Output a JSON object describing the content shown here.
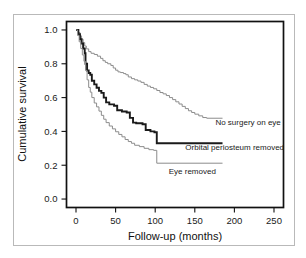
{
  "chart_data": {
    "type": "line",
    "subtype": "kaplan-meier-step",
    "title": "",
    "xlabel": "Follow-up (months)",
    "ylabel": "Cumulative survival",
    "xlim": [
      -12,
      262
    ],
    "ylim": [
      -0.05,
      1.05
    ],
    "xticks": [
      0,
      50,
      100,
      150,
      200,
      250
    ],
    "xticklabels": [
      "0",
      "50",
      "100",
      "150",
      "200",
      "250"
    ],
    "yticks": [
      0.0,
      0.2,
      0.4,
      0.6,
      0.8,
      1.0
    ],
    "yticklabels": [
      "0.0",
      "0.2",
      "0.4",
      "0.6",
      "0.8",
      "1.0"
    ],
    "grid": false,
    "legend_position": "inline-right-of-curve",
    "series": [
      {
        "name": "No surgery on eye",
        "label": "No surgery on eye",
        "color": "#8c8c8c",
        "stroke_width": 1.0,
        "label_x": 171,
        "label_y": 0.455,
        "points": [
          [
            0,
            1.0
          ],
          [
            3,
            0.985
          ],
          [
            5,
            0.965
          ],
          [
            7,
            0.945
          ],
          [
            9,
            0.925
          ],
          [
            11,
            0.905
          ],
          [
            13,
            0.888
          ],
          [
            16,
            0.872
          ],
          [
            19,
            0.862
          ],
          [
            23,
            0.855
          ],
          [
            27,
            0.845
          ],
          [
            31,
            0.832
          ],
          [
            34,
            0.818
          ],
          [
            37,
            0.808
          ],
          [
            40,
            0.8
          ],
          [
            44,
            0.79
          ],
          [
            47,
            0.775
          ],
          [
            50,
            0.762
          ],
          [
            53,
            0.752
          ],
          [
            56,
            0.748
          ],
          [
            60,
            0.742
          ],
          [
            63,
            0.735
          ],
          [
            66,
            0.722
          ],
          [
            70,
            0.712
          ],
          [
            74,
            0.705
          ],
          [
            78,
            0.698
          ],
          [
            82,
            0.69
          ],
          [
            86,
            0.678
          ],
          [
            90,
            0.668
          ],
          [
            94,
            0.66
          ],
          [
            98,
            0.652
          ],
          [
            102,
            0.642
          ],
          [
            106,
            0.63
          ],
          [
            110,
            0.622
          ],
          [
            114,
            0.612
          ],
          [
            118,
            0.6
          ],
          [
            122,
            0.588
          ],
          [
            126,
            0.575
          ],
          [
            130,
            0.562
          ],
          [
            134,
            0.548
          ],
          [
            138,
            0.535
          ],
          [
            142,
            0.522
          ],
          [
            146,
            0.512
          ],
          [
            150,
            0.502
          ],
          [
            155,
            0.492
          ],
          [
            160,
            0.482
          ],
          [
            165,
            0.478
          ],
          [
            185,
            0.478
          ]
        ]
      },
      {
        "name": "Orbital periosteum removed",
        "label": "Orbital periosteum removed",
        "color": "#1a1a1a",
        "stroke_width": 1.9,
        "label_x": 133,
        "label_y": 0.305,
        "points": [
          [
            0,
            1.0
          ],
          [
            3,
            0.975
          ],
          [
            5,
            0.945
          ],
          [
            7,
            0.92
          ],
          [
            9,
            0.89
          ],
          [
            11,
            0.862
          ],
          [
            12,
            0.8
          ],
          [
            14,
            0.76
          ],
          [
            16,
            0.745
          ],
          [
            18,
            0.735
          ],
          [
            20,
            0.7
          ],
          [
            23,
            0.678
          ],
          [
            26,
            0.658
          ],
          [
            29,
            0.64
          ],
          [
            32,
            0.628
          ],
          [
            35,
            0.6
          ],
          [
            38,
            0.572
          ],
          [
            42,
            0.56
          ],
          [
            48,
            0.552
          ],
          [
            52,
            0.525
          ],
          [
            58,
            0.518
          ],
          [
            64,
            0.512
          ],
          [
            68,
            0.48
          ],
          [
            72,
            0.452
          ],
          [
            76,
            0.448
          ],
          [
            84,
            0.442
          ],
          [
            88,
            0.408
          ],
          [
            94,
            0.4
          ],
          [
            99,
            0.395
          ],
          [
            102,
            0.33
          ],
          [
            185,
            0.33
          ]
        ]
      },
      {
        "name": "Eye removed",
        "label": "Eye removed",
        "color": "#8c8c8c",
        "stroke_width": 1.0,
        "label_x": 112,
        "label_y": 0.168,
        "points": [
          [
            0,
            1.0
          ],
          [
            2,
            0.968
          ],
          [
            4,
            0.93
          ],
          [
            6,
            0.89
          ],
          [
            8,
            0.852
          ],
          [
            10,
            0.815
          ],
          [
            12,
            0.76
          ],
          [
            14,
            0.705
          ],
          [
            16,
            0.66
          ],
          [
            18,
            0.632
          ],
          [
            20,
            0.6
          ],
          [
            23,
            0.568
          ],
          [
            26,
            0.545
          ],
          [
            29,
            0.52
          ],
          [
            32,
            0.495
          ],
          [
            35,
            0.472
          ],
          [
            38,
            0.452
          ],
          [
            42,
            0.432
          ],
          [
            46,
            0.415
          ],
          [
            50,
            0.398
          ],
          [
            54,
            0.382
          ],
          [
            58,
            0.368
          ],
          [
            62,
            0.352
          ],
          [
            66,
            0.34
          ],
          [
            70,
            0.33
          ],
          [
            74,
            0.318
          ],
          [
            80,
            0.31
          ],
          [
            86,
            0.3
          ],
          [
            92,
            0.292
          ],
          [
            98,
            0.288
          ],
          [
            102,
            0.212
          ],
          [
            185,
            0.212
          ]
        ]
      }
    ]
  },
  "axes": {
    "y_axis_title": "Cumulative survival",
    "x_axis_title": "Follow-up (months)"
  }
}
